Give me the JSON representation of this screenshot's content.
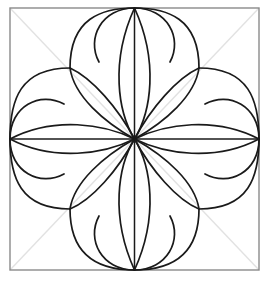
{
  "figure": {
    "type": "geometric-line-drawing",
    "canvas": {
      "width": 266,
      "height": 281,
      "background": "#ffffff"
    },
    "colors": {
      "border": "#8a8a8a",
      "diagonal": "#e2e2e2",
      "axis": "#1a1a1a",
      "curve": "#1a1a1a"
    },
    "stroke_widths": {
      "border": 1.4,
      "diagonal": 1.4,
      "axis": 1.5,
      "curve": 1.7
    },
    "square": {
      "left": 10,
      "top": 8,
      "right": 259,
      "bottom": 270
    },
    "center": {
      "x": 134.5,
      "y": 139
    },
    "nodes": [
      {
        "name": "node-top-left",
        "x": 70,
        "y": 68
      },
      {
        "name": "node-top-right",
        "x": 199,
        "y": 68
      },
      {
        "name": "node-bottom-left",
        "x": 70,
        "y": 209
      },
      {
        "name": "node-bottom-right",
        "x": 199,
        "y": 209
      }
    ],
    "edge_midpoints": [
      {
        "name": "mid-top",
        "x": 134.5,
        "y": 8
      },
      {
        "name": "mid-right",
        "x": 259,
        "y": 139
      },
      {
        "name": "mid-bottom",
        "x": 134.5,
        "y": 270
      },
      {
        "name": "mid-left",
        "x": 10,
        "y": 139
      }
    ],
    "lobes": {
      "count": 8,
      "description": "Eight outer teardrop lobes, each spanning from a corner node to an adjacent edge midpoint, tangent to the square edge"
    },
    "petals": {
      "count": 8,
      "description": "Eight inner petals radiating from the center point to the four corner nodes and four edge midpoints"
    },
    "axes": {
      "horizontal": {
        "y": 139,
        "x1": 10,
        "x2": 259
      },
      "vertical": {
        "x": 134.5,
        "y1": 8,
        "y2": 270
      }
    },
    "diagonals": [
      {
        "name": "diagonal-main",
        "x1": 10,
        "y1": 8,
        "x2": 259,
        "y2": 270
      },
      {
        "name": "diagonal-anti",
        "x1": 259,
        "y1": 8,
        "x2": 10,
        "y2": 270
      }
    ]
  }
}
